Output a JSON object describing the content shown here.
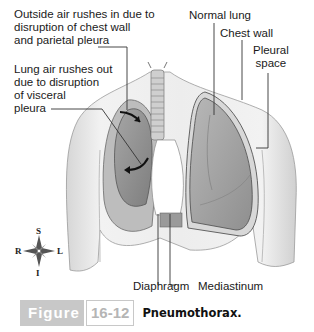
{
  "figure": {
    "labels": {
      "outside_air": [
        "Outside air rushes in due to",
        "disruption of chest wall",
        "and parietal pleura"
      ],
      "lung_air": [
        "Lung air rushes out",
        "due to disruption",
        "of visceral",
        "pleura"
      ],
      "normal_lung": "Normal lung",
      "chest_wall": "Chest wall",
      "pleural_space": [
        "Pleural",
        "space"
      ],
      "diaphragm": "Diaphragm",
      "mediastinum": "Mediastinum"
    },
    "compass": {
      "superior": "S",
      "inferior": "I",
      "right": "R",
      "left": "L"
    },
    "caption": {
      "word": "Figure",
      "number": "16-12",
      "title": "Pneumothorax."
    },
    "colors": {
      "skin_light": "#efefef",
      "skin_shade": "#cfcfcf",
      "lung_fill": "#a9a9a9",
      "lung_dark": "#8a8a8a",
      "caption_gray": "#c8c8c8",
      "leader_line": "#333333"
    }
  }
}
